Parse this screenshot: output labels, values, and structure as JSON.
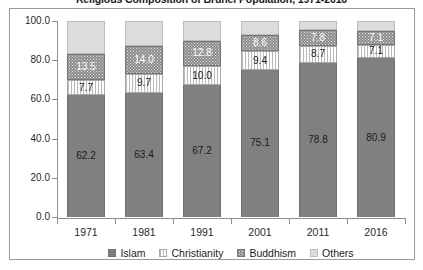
{
  "chart_data": {
    "type": "bar",
    "subtype": "stacked-column-100",
    "title": "Religious Composition of Brunei Population, 1971-2016",
    "xlabel": "",
    "ylabel": "",
    "categories": [
      "1971",
      "1981",
      "1991",
      "2001",
      "2011",
      "2016"
    ],
    "ylim": [
      0.0,
      100.0
    ],
    "yticks": [
      "0.0",
      "20.0",
      "40.0",
      "60.0",
      "80.0",
      "100.0"
    ],
    "ytick_values": [
      0.0,
      20.0,
      40.0,
      60.0,
      80.0,
      100.0
    ],
    "grid": false,
    "legend_position": "bottom",
    "series": [
      {
        "name": "Islam",
        "color": "#808080",
        "pattern": "solid",
        "values": [
          62.2,
          63.4,
          67.2,
          75.1,
          78.8,
          80.9
        ],
        "labels": [
          "62.2",
          "63.4",
          "67.2",
          "75.1",
          "78.8",
          "80.9"
        ],
        "labels_shown": true
      },
      {
        "name": "Christianity",
        "color": "#fdfdfd",
        "pattern": "vertical-stripes",
        "values": [
          7.7,
          9.7,
          10.0,
          9.4,
          8.7,
          7.1
        ],
        "labels": [
          "7.7",
          "9.7",
          "10.0",
          "9.4",
          "8.7",
          "7.1"
        ],
        "labels_shown": true
      },
      {
        "name": "Buddhism",
        "color": "#8a8a8a",
        "pattern": "dotted",
        "values": [
          13.5,
          14.0,
          12.8,
          8.6,
          7.8,
          7.1
        ],
        "labels": [
          "13.5",
          "14.0",
          "12.8",
          "8.6",
          "7.8",
          "7.1"
        ],
        "labels_shown": true
      },
      {
        "name": "Others",
        "color": "#dcdcdc",
        "pattern": "solid",
        "values": [
          16.6,
          12.9,
          10.0,
          6.9,
          4.7,
          4.9
        ],
        "labels": [
          "",
          "",
          "",
          "",
          "",
          ""
        ],
        "labels_shown": false
      }
    ]
  }
}
